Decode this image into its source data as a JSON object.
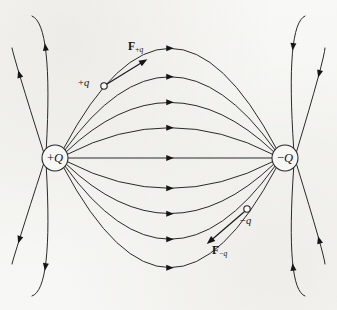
{
  "figure": {
    "width": 337,
    "height": 310,
    "background_color": "#f7f7f5",
    "line_color": "#2a2a2a",
    "text_color": "#131313"
  },
  "charges": {
    "positive": {
      "label_sign": "+",
      "label_symbol": "Q",
      "name": "positive-source-charge",
      "cx": 55,
      "cy": 158,
      "r": 13
    },
    "negative": {
      "label_sign": "−",
      "label_symbol": "Q",
      "name": "negative-source-charge",
      "cx": 285,
      "cy": 158,
      "r": 13
    }
  },
  "test_charges": [
    {
      "name": "positive-test-charge",
      "label_sign": "+",
      "label_symbol": "q",
      "cx": 104,
      "cy": 86,
      "r": 3.2,
      "label_x": 78,
      "label_y": 78
    },
    {
      "name": "negative-test-charge",
      "label_sign": "−",
      "label_symbol": "q",
      "cx": 247,
      "cy": 209,
      "r": 3.2,
      "label_x": 240,
      "label_y": 216
    }
  ],
  "force_vectors": [
    {
      "name": "force-on-positive-test-charge",
      "label_base": "F",
      "label_sub_sign": "+",
      "label_sub_symbol": "q",
      "x1": 107,
      "y1": 84,
      "x2": 146,
      "y2": 60,
      "label_x": 128,
      "label_y": 41
    },
    {
      "name": "force-on-negative-test-charge",
      "label_base": "F",
      "label_sub_sign": "−",
      "label_sub_symbol": "q",
      "x1": 244,
      "y1": 212,
      "x2": 208,
      "y2": 243,
      "label_x": 212,
      "label_y": 245
    }
  ],
  "chart_data": {
    "type": "diagram",
    "connecting_line_count": 9,
    "outer_line_count": 4,
    "field_direction": "from +Q to -Q",
    "arrow_direction_center": "right",
    "arrow_direction_outer_left_top": "up",
    "arrow_direction_outer_left_bottom": "down",
    "arrow_direction_outer_right_top": "down",
    "arrow_direction_outer_right_bottom": "up",
    "connecting_lines": [
      {
        "index": 0,
        "bulge": -140,
        "arrow_t": 0.5
      },
      {
        "index": 1,
        "bulge": -103,
        "arrow_t": 0.5
      },
      {
        "index": 2,
        "bulge": -70,
        "arrow_t": 0.5
      },
      {
        "index": 3,
        "bulge": -38,
        "arrow_t": 0.5
      },
      {
        "index": 4,
        "bulge": 0,
        "arrow_t": 0.5
      },
      {
        "index": 5,
        "bulge": 38,
        "arrow_t": 0.5
      },
      {
        "index": 6,
        "bulge": 70,
        "arrow_t": 0.5
      },
      {
        "index": 7,
        "bulge": 103,
        "arrow_t": 0.5
      },
      {
        "index": 8,
        "bulge": 140,
        "arrow_t": 0.5
      }
    ]
  }
}
